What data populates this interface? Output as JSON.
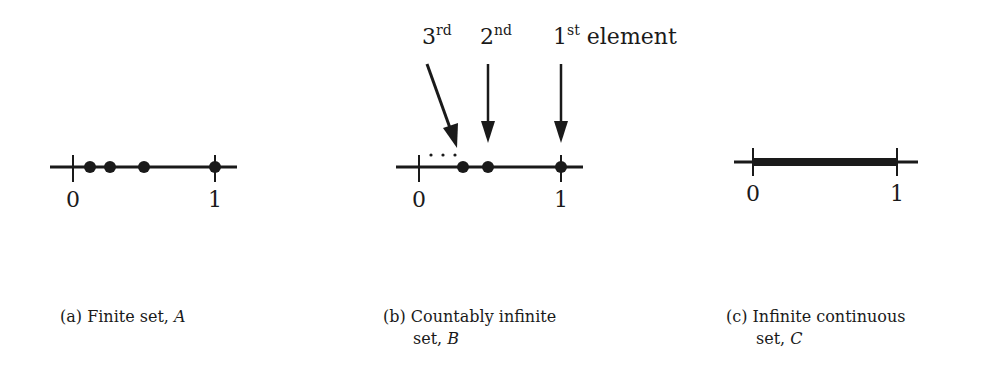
{
  "figure": {
    "panels": [
      {
        "id": "a",
        "caption_prefix": "(a)",
        "caption_text": "Finite set,",
        "caption_var": "A",
        "tick_labels": [
          "0",
          "1"
        ],
        "points": [
          0.12,
          0.26,
          0.5,
          1.0
        ],
        "type": "finite-points"
      },
      {
        "id": "b",
        "caption_prefix": "(b)",
        "caption_text": "Countably infinite",
        "caption_line2": "set,",
        "caption_var": "B",
        "tick_labels": [
          "0",
          "1"
        ],
        "points": [
          0.31,
          0.48,
          1.0
        ],
        "ellipsis": "· · ·",
        "arrow_labels": [
          {
            "num": "3",
            "sup": "rd",
            "suffix": ""
          },
          {
            "num": "2",
            "sup": "nd",
            "suffix": ""
          },
          {
            "num": "1",
            "sup": "st",
            "suffix": " element"
          }
        ],
        "type": "countable-sequence"
      },
      {
        "id": "c",
        "caption_prefix": "(c)",
        "caption_text": "Infinite continuous",
        "caption_line2": "set,",
        "caption_var": "C",
        "tick_labels": [
          "0",
          "1"
        ],
        "interval": [
          0,
          1
        ],
        "type": "continuous-interval"
      }
    ],
    "colors": {
      "ink": "#1a1a1a",
      "background": "#ffffff"
    }
  }
}
